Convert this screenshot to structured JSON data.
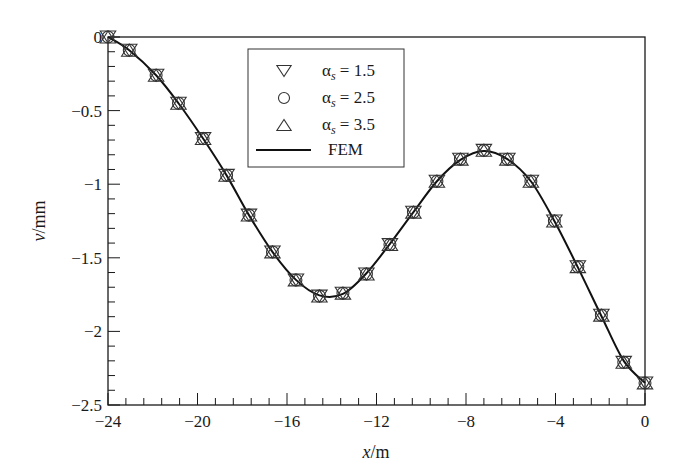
{
  "chart_data": {
    "type": "line",
    "title": "",
    "xlabel": "x/m",
    "xlabel_parts": {
      "var": "x",
      "unit": "/m"
    },
    "ylabel": "v/mm",
    "ylabel_parts": {
      "var": "v",
      "unit": "/mm"
    },
    "xlim": [
      -24,
      0
    ],
    "ylim": [
      -2.5,
      0
    ],
    "xticks": [
      -24,
      -20,
      -16,
      -12,
      -8,
      -4,
      0
    ],
    "xtick_labels": [
      "−24",
      "−20",
      "−16",
      "−12",
      "−8",
      "−4",
      "0"
    ],
    "x_minor_step": 0.8,
    "yticks": [
      0,
      -0.5,
      -1,
      -1.5,
      -2,
      -2.5
    ],
    "ytick_labels": [
      "0",
      "−0.5",
      "−1",
      "−1.5",
      "−2",
      "−2.5"
    ],
    "y_minor_step": 0.1,
    "grid": false,
    "legend_position": "top-center",
    "x": [
      -24,
      -23.05,
      -21.85,
      -20.85,
      -19.75,
      -18.7,
      -17.7,
      -16.65,
      -15.6,
      -14.55,
      -13.5,
      -12.45,
      -11.4,
      -10.35,
      -9.3,
      -8.25,
      -7.2,
      -6.15,
      -5.1,
      -4.05,
      -3.0,
      -1.95,
      -0.95,
      0
    ],
    "series": [
      {
        "name": "αs = 1.5",
        "label_symbol": "α",
        "label_sub": "s",
        "label_value": "= 1.5",
        "marker": "triangle-down",
        "style": "markers",
        "values": [
          0,
          -0.09,
          -0.26,
          -0.45,
          -0.69,
          -0.94,
          -1.21,
          -1.46,
          -1.65,
          -1.76,
          -1.74,
          -1.61,
          -1.41,
          -1.19,
          -0.98,
          -0.83,
          -0.77,
          -0.83,
          -0.98,
          -1.25,
          -1.56,
          -1.89,
          -2.21,
          -2.35
        ]
      },
      {
        "name": "αs = 2.5",
        "label_symbol": "α",
        "label_sub": "s",
        "label_value": "= 2.5",
        "marker": "circle",
        "style": "markers",
        "values": [
          0,
          -0.09,
          -0.26,
          -0.45,
          -0.69,
          -0.94,
          -1.21,
          -1.46,
          -1.65,
          -1.76,
          -1.74,
          -1.61,
          -1.41,
          -1.19,
          -0.98,
          -0.83,
          -0.77,
          -0.83,
          -0.98,
          -1.25,
          -1.56,
          -1.89,
          -2.21,
          -2.35
        ]
      },
      {
        "name": "αs = 3.5",
        "label_symbol": "α",
        "label_sub": "s",
        "label_value": "= 3.5",
        "marker": "triangle-up",
        "style": "markers",
        "values": [
          0,
          -0.09,
          -0.26,
          -0.45,
          -0.69,
          -0.94,
          -1.21,
          -1.46,
          -1.65,
          -1.76,
          -1.74,
          -1.61,
          -1.41,
          -1.19,
          -0.98,
          -0.83,
          -0.77,
          -0.83,
          -0.98,
          -1.25,
          -1.56,
          -1.89,
          -2.21,
          -2.35
        ]
      },
      {
        "name": "FEM",
        "marker": "none",
        "style": "line",
        "values": [
          0,
          -0.09,
          -0.26,
          -0.45,
          -0.69,
          -0.94,
          -1.21,
          -1.46,
          -1.65,
          -1.755,
          -1.745,
          -1.605,
          -1.405,
          -1.19,
          -0.98,
          -0.835,
          -0.775,
          -0.83,
          -0.98,
          -1.25,
          -1.565,
          -1.895,
          -2.2,
          -2.35
        ]
      }
    ],
    "colors": {
      "axis": "#1a1a1a",
      "line": "#111111",
      "marker": "#333333"
    }
  }
}
